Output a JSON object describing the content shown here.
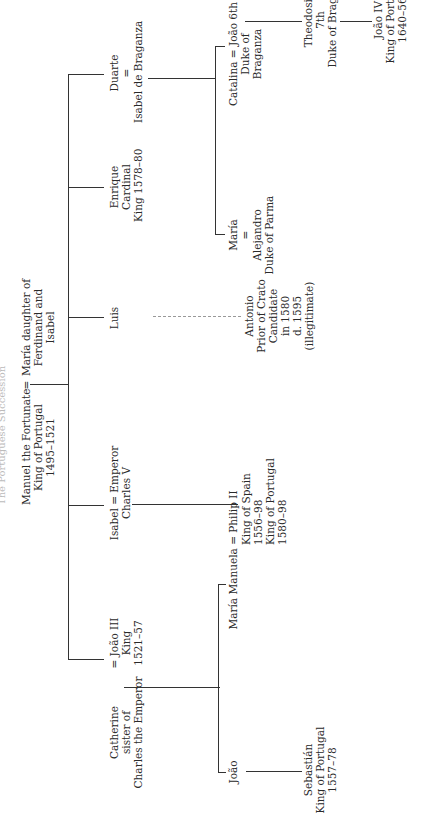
{
  "title": "The Portuguese Succession",
  "root": {
    "husband": [
      "Manuel the Fortunate",
      "King of Portugal",
      "1495–1521"
    ],
    "marriage_sign": "=",
    "wife": [
      "María daughter of",
      "Ferdinand and",
      "Isabel"
    ]
  },
  "children": {
    "catherine": [
      "Catherine",
      "sister of",
      "Charles the Emperor"
    ],
    "joao3": [
      "= João III",
      "King",
      "1521–57"
    ],
    "isabel": [
      "Isabel = Emperor",
      "Charles V"
    ],
    "luis": [
      "Luis"
    ],
    "enrique": [
      "Enrique",
      "Cardinal",
      "King 1578–80"
    ],
    "duarte": [
      "Duarte",
      "=",
      "Isabel de Braganza"
    ]
  },
  "grandchildren": {
    "joao": [
      "João"
    ],
    "maria_manuela": [
      "María Manuela = Philip II"
    ],
    "philip": [
      "King of Spain",
      "1556–98",
      "King of Portugal",
      "1580–98"
    ],
    "antonio": [
      "Antonio",
      "Prior of Crato",
      "Candidate",
      "in 1580",
      "d. 1595",
      "(illegitimate)"
    ],
    "maria": [
      "María",
      "=",
      "Alejandro",
      "Duke of Parma"
    ],
    "catalina": [
      "Catalina = João 6th",
      "Duke of",
      "Braganza"
    ]
  },
  "great_grandchildren": {
    "sebastian": [
      "Sebastián",
      "King of Portugal",
      "1557–78"
    ],
    "theodosio": [
      "Theodosio",
      "7th",
      "Duke of Braganza"
    ]
  },
  "great_great_grandchildren": {
    "joao4": [
      "João IV",
      "King of Portugal",
      "1640–56"
    ]
  }
}
